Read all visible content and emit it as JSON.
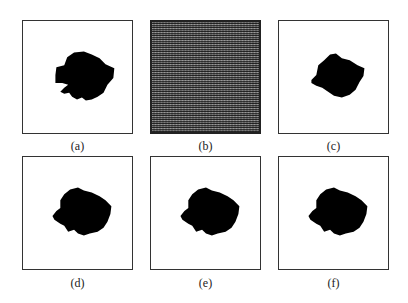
{
  "figure": {
    "panels": [
      {
        "id": "a",
        "label": "(a)",
        "type": "binary-mask",
        "description": "ground-truth shape"
      },
      {
        "id": "b",
        "label": "(b)",
        "type": "noise",
        "description": "noisy image"
      },
      {
        "id": "c",
        "label": "(c)",
        "type": "binary-mask",
        "description": "segmentation result"
      },
      {
        "id": "d",
        "label": "(d)",
        "type": "binary-mask",
        "description": "segmentation result"
      },
      {
        "id": "e",
        "label": "(e)",
        "type": "binary-mask",
        "description": "segmentation result"
      },
      {
        "id": "f",
        "label": "(f)",
        "type": "binary-mask",
        "description": "segmentation result"
      }
    ],
    "colors": {
      "background": "#ffffff",
      "shape": "#000000",
      "border": "#333333"
    }
  }
}
